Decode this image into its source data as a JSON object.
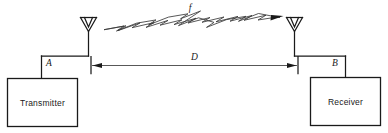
{
  "figure": {
    "background_color": "#ffffff",
    "line_color": "#1a1a1a"
  },
  "blocks": [
    {
      "id": "transmitter",
      "label": "Transmitter",
      "side": "left"
    },
    {
      "id": "receiver",
      "label": "Receiver",
      "side": "right"
    }
  ],
  "terminal_labels": [
    {
      "id": "terminal-a",
      "label": "A",
      "side": "left"
    },
    {
      "id": "terminal-b",
      "label": "B",
      "side": "right"
    }
  ],
  "wave": {
    "label": "f",
    "description": "zigzag radio wave travelling left to right",
    "direction": "left-to-right"
  },
  "dimension": {
    "label": "D",
    "description": "separation distance between antennas",
    "arrow_style": "double-headed"
  },
  "antennas": [
    {
      "id": "antenna-transmit",
      "type": "dipole-horn",
      "side": "left"
    },
    {
      "id": "antenna-receive",
      "type": "dipole-horn",
      "side": "right"
    }
  ]
}
